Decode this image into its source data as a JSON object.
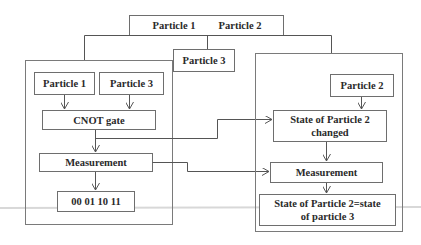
{
  "diagram": {
    "top": {
      "label_a": "Particle 1",
      "label_b": "Particle 2"
    },
    "shared_particle": "Particle 3",
    "alice": {
      "particle_1": "Particle 1",
      "particle_3": "Particle 3",
      "cnot": "CNOT gate",
      "measurement": "Measurement",
      "outcomes": "00 01 10 11"
    },
    "bob": {
      "particle_2": "Particle 2",
      "state_changed_line1": "State of Particle 2",
      "state_changed_line2": "changed",
      "measurement": "Measurement",
      "result_line1": "State of Particle 2=state",
      "result_line2": "of particle 3"
    },
    "colors": {
      "stroke": "#6e6e6e",
      "text": "#2a2a2a",
      "background": "#ffffff"
    }
  }
}
